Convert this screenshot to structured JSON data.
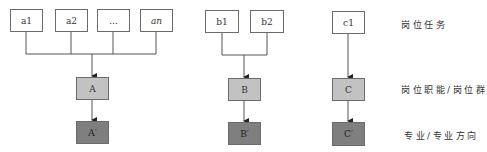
{
  "groups": {
    "a": {
      "tasks": [
        "a1",
        "a2",
        "...",
        "an"
      ],
      "function": "A",
      "major": "A′"
    },
    "b": {
      "tasks": [
        "b1",
        "b2"
      ],
      "function": "B",
      "major": "B′"
    },
    "c": {
      "tasks": [
        "c1"
      ],
      "function": "C",
      "major": "C′"
    }
  },
  "row_labels": {
    "tasks": "岗位任务",
    "functions": "岗位职能/岗位群",
    "majors": "专业/专业方向"
  },
  "colors": {
    "task_fill": "#ffffff",
    "function_fill": "#c2c2c2",
    "major_fill": "#7f7f7f",
    "line": "#555555"
  }
}
